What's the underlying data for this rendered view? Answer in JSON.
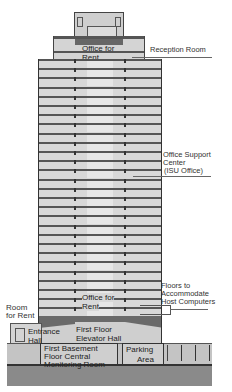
{
  "diagram": {
    "type": "building-section",
    "colors": {
      "slab": "#555555",
      "wall": "#d8d8d8",
      "core": "#e6e6e6",
      "basement": "#888888",
      "outline": "#333333"
    },
    "labels": {
      "office_for_rent_top": "Office for Rent",
      "reception_room": "Reception Room",
      "office_support_center": [
        "Office Support",
        "Center",
        "(ISU Office)"
      ],
      "floors_host_computers": [
        "Floors to",
        "Accommodate",
        "Host Computers"
      ],
      "office_for_rent_low": "Office for Rent",
      "room_for_rent": [
        "Room",
        "for Rent"
      ],
      "entrance_hall": [
        "Entrance",
        "Hall"
      ],
      "first_floor_elevator_hall": [
        "First Floor",
        "Elevator Hall"
      ],
      "basement_monitoring": [
        "First Basement",
        "Floor Central",
        "Monitoring Room"
      ],
      "parking_area": [
        "Parking",
        "Area"
      ]
    }
  }
}
